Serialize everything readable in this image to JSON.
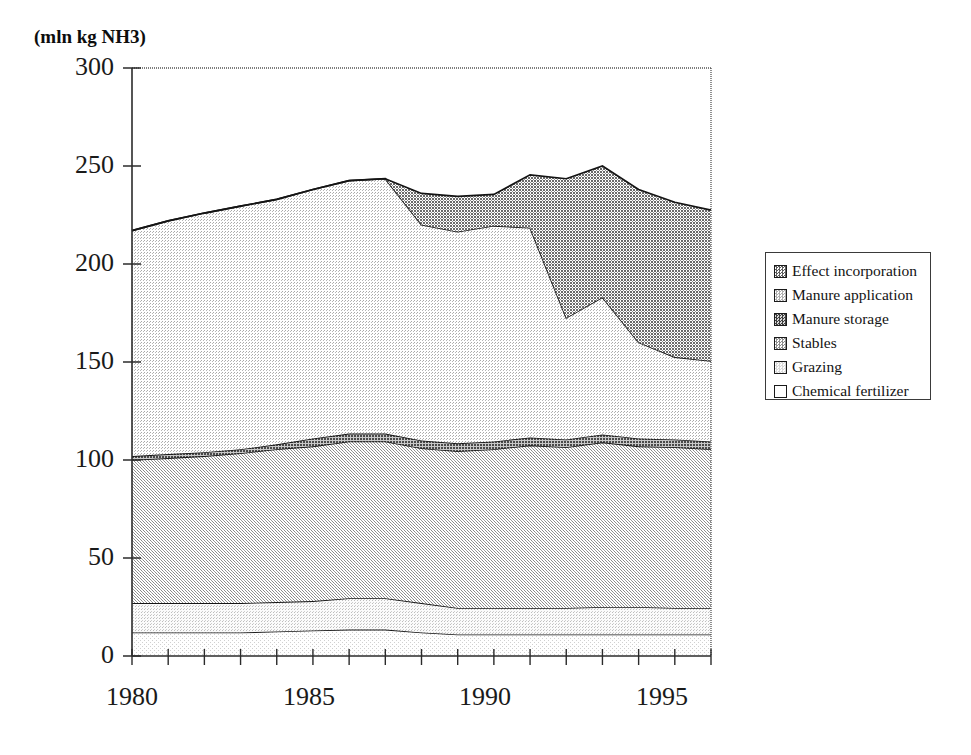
{
  "chart_data": {
    "type": "area",
    "title": "",
    "ylabel": "(mln kg NH3)",
    "xlabel": "",
    "ylim": [
      0,
      300
    ],
    "xlim": [
      1980,
      1996
    ],
    "yticks": [
      0,
      50,
      100,
      150,
      200,
      250,
      300
    ],
    "xticks": [
      1980,
      1985,
      1990,
      1995
    ],
    "xtick_minor_step": 1,
    "grid": false,
    "stacked": true,
    "legend_position": "right-outside",
    "x": [
      1980,
      1981,
      1982,
      1983,
      1984,
      1985,
      1986,
      1987,
      1988,
      1989,
      1990,
      1991,
      1992,
      1993,
      1994,
      1995,
      1996
    ],
    "series": [
      {
        "name": "Chemical fertilizer",
        "values": [
          12,
          12,
          12,
          12,
          12.5,
          13,
          13.5,
          13.5,
          12,
          11,
          11,
          11,
          11,
          11,
          11,
          11,
          11
        ]
      },
      {
        "name": "Grazing",
        "values": [
          15,
          15,
          15,
          15,
          15,
          15,
          16,
          16,
          15,
          13.5,
          13.5,
          13.5,
          13.5,
          14,
          14,
          13.5,
          13.5
        ]
      },
      {
        "name": "Stables",
        "values": [
          73,
          74,
          75,
          76.5,
          78,
          79,
          80,
          80,
          79,
          80,
          81,
          83,
          82,
          84,
          82,
          82,
          81
        ]
      },
      {
        "name": "Manure storage",
        "values": [
          2,
          2,
          2,
          2,
          2.5,
          4,
          4,
          4,
          4,
          4,
          4,
          4,
          4,
          4,
          4,
          4,
          4
        ]
      },
      {
        "name": "Manure application",
        "values": [
          115,
          119,
          122,
          124,
          125,
          127,
          129,
          130,
          110,
          108,
          110,
          107,
          62,
          70,
          49,
          42,
          41
        ]
      },
      {
        "name": "Effect incorporation",
        "values": [
          0,
          0,
          0,
          0,
          0,
          0,
          0,
          0,
          16,
          18,
          16,
          27,
          71,
          67,
          78,
          79,
          77
        ]
      }
    ],
    "series_totals": [
      217,
      222,
      226,
      229.5,
      233,
      238,
      242.5,
      243.5,
      236,
      234.5,
      235.5,
      245.5,
      243.5,
      250,
      238,
      231.5,
      227.5
    ],
    "swatch_colors": {
      "Effect incorporation": "#8e8e8e",
      "Manure application": "#d6d6d6",
      "Manure storage": "#7a7a7a",
      "Stables": "#bcbcbc",
      "Grazing": "#e8e8e8",
      "Chemical fertilizer": "#f4f4f4"
    }
  },
  "axis": {
    "y_title": "(mln kg NH3)",
    "y_labels": [
      "300",
      "250",
      "200",
      "150",
      "100",
      "50",
      "0"
    ],
    "x_labels": [
      "1980",
      "1985",
      "1990",
      "1995"
    ]
  },
  "legend": {
    "items": [
      {
        "label": "Effect incorporation",
        "color": "#8e8e8e"
      },
      {
        "label": "Manure application",
        "color": "#d6d6d6"
      },
      {
        "label": "Manure storage",
        "color": "#7a7a7a"
      },
      {
        "label": "Stables",
        "color": "#bcbcbc"
      },
      {
        "label": "Grazing",
        "color": "#e8e8e8"
      },
      {
        "label": "Chemical fertilizer",
        "color": "#f6f6f6"
      }
    ]
  }
}
